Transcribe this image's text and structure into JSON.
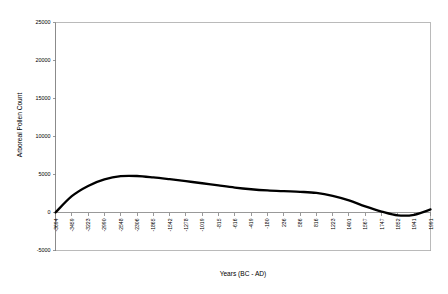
{
  "chart_data": {
    "type": "line",
    "title": "",
    "xlabel": "Years (BC - AD)",
    "ylabel": "Arboreal Pollen Count",
    "ylim": [
      -5000,
      25000
    ],
    "ytick_values": [
      -5000,
      0,
      5000,
      10000,
      15000,
      20000,
      25000
    ],
    "ytick_labels": [
      "-5000",
      "0",
      "5000",
      "10000",
      "15000",
      "20000",
      "25000"
    ],
    "grid": false,
    "legend": false,
    "legend_position": "none",
    "categories": [
      "-3694",
      "-3459",
      "-3223",
      "-2990",
      "-2548",
      "-2306",
      "-1865",
      "-1542",
      "-1278",
      "-1019",
      "-815",
      "-616",
      "-419",
      "-180",
      "236",
      "586",
      "816",
      "1223",
      "1401",
      "1567",
      "1747",
      "1852",
      "1941",
      "1991"
    ],
    "values": [
      0,
      2150,
      3500,
      4350,
      4780,
      4800,
      4620,
      4380,
      4120,
      3850,
      3560,
      3280,
      3060,
      2900,
      2800,
      2720,
      2580,
      2200,
      1600,
      800,
      120,
      -380,
      -300,
      400
    ],
    "series": [
      {
        "name": "Arboreal Pollen Count",
        "color": "#000000",
        "values": [
          0,
          2150,
          3500,
          4350,
          4780,
          4800,
          4620,
          4380,
          4120,
          3850,
          3560,
          3280,
          3060,
          2900,
          2800,
          2720,
          2580,
          2200,
          1600,
          800,
          120,
          -380,
          -300,
          400
        ]
      }
    ]
  },
  "colors": {
    "series": "#000000",
    "axis": "#808080",
    "border": "#a9a9a9",
    "background": "#ffffff"
  }
}
